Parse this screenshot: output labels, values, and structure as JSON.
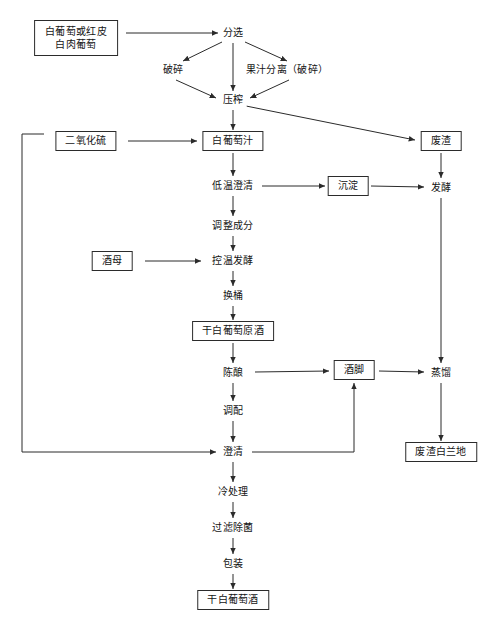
{
  "diagram": {
    "type": "flowchart",
    "orientation": "top-to-bottom",
    "canvas": {
      "width": 504,
      "height": 624
    },
    "colors": {
      "line": "#2b2b2b",
      "text": "#141414",
      "background": "#ffffff"
    },
    "nodes": [
      {
        "id": "grapes",
        "label": "白葡萄或红皮\n白肉葡萄",
        "label_line1": "白葡萄或红皮",
        "label_line2": "白肉葡萄",
        "shape": "box",
        "x": 76,
        "y": 38
      },
      {
        "id": "sorting",
        "label": "分选",
        "shape": "plain",
        "x": 233,
        "y": 33
      },
      {
        "id": "crushing",
        "label": "破碎",
        "shape": "plain",
        "x": 173,
        "y": 70
      },
      {
        "id": "juice-sep",
        "label": "果汁分离（破碎）",
        "shape": "plain",
        "x": 287,
        "y": 70
      },
      {
        "id": "pressing",
        "label": "压榨",
        "shape": "plain",
        "x": 233,
        "y": 100
      },
      {
        "id": "so2",
        "label": "二氧化硫",
        "shape": "box",
        "x": 86,
        "y": 141
      },
      {
        "id": "white-must",
        "label": "白葡萄汁",
        "shape": "box",
        "x": 233,
        "y": 141
      },
      {
        "id": "pomace",
        "label": "废渣",
        "shape": "box",
        "x": 441,
        "y": 141
      },
      {
        "id": "cold-settle",
        "label": "低温澄清",
        "shape": "plain",
        "x": 233,
        "y": 186
      },
      {
        "id": "sediment",
        "label": "沉淀",
        "shape": "box",
        "x": 348,
        "y": 186
      },
      {
        "id": "fermentation",
        "label": "发酵",
        "shape": "plain",
        "x": 441,
        "y": 188
      },
      {
        "id": "adjust",
        "label": "调整成分",
        "shape": "plain",
        "x": 233,
        "y": 226
      },
      {
        "id": "yeast",
        "label": "酒母",
        "shape": "box",
        "x": 112,
        "y": 261
      },
      {
        "id": "temp-ferment",
        "label": "控温发酵",
        "shape": "plain",
        "x": 233,
        "y": 261
      },
      {
        "id": "racking",
        "label": "换桶",
        "shape": "plain",
        "x": 233,
        "y": 296
      },
      {
        "id": "base-wine",
        "label": "干白葡萄原酒",
        "shape": "box",
        "x": 233,
        "y": 331
      },
      {
        "id": "aging",
        "label": "陈酿",
        "shape": "plain",
        "x": 233,
        "y": 373
      },
      {
        "id": "lees",
        "label": "酒脚",
        "shape": "box",
        "x": 354,
        "y": 370
      },
      {
        "id": "distillation",
        "label": "蒸馏",
        "shape": "plain",
        "x": 441,
        "y": 373
      },
      {
        "id": "blending",
        "label": "调配",
        "shape": "plain",
        "x": 233,
        "y": 411
      },
      {
        "id": "clarify",
        "label": "澄清",
        "shape": "plain",
        "x": 233,
        "y": 452
      },
      {
        "id": "pomace-brandy",
        "label": "废渣白兰地",
        "shape": "box",
        "x": 441,
        "y": 452
      },
      {
        "id": "cold-treat",
        "label": "冷处理",
        "shape": "plain",
        "x": 233,
        "y": 492
      },
      {
        "id": "filter",
        "label": "过滤除菌",
        "shape": "plain",
        "x": 233,
        "y": 528
      },
      {
        "id": "packaging",
        "label": "包装",
        "shape": "plain",
        "x": 233,
        "y": 564
      },
      {
        "id": "dry-white",
        "label": "干白葡萄酒",
        "shape": "box",
        "x": 233,
        "y": 600
      }
    ],
    "edges": [
      {
        "from": "grapes",
        "to": "sorting",
        "kind": "straight"
      },
      {
        "from": "sorting",
        "to": "crushing",
        "kind": "diagonal"
      },
      {
        "from": "sorting",
        "to": "pressing",
        "kind": "straight"
      },
      {
        "from": "sorting",
        "to": "juice-sep",
        "kind": "diagonal"
      },
      {
        "from": "crushing",
        "to": "pressing",
        "kind": "diagonal"
      },
      {
        "from": "juice-sep",
        "to": "pressing",
        "kind": "diagonal"
      },
      {
        "from": "pressing",
        "to": "white-must",
        "kind": "straight"
      },
      {
        "from": "pressing",
        "to": "pomace",
        "kind": "diagonal"
      },
      {
        "from": "so2",
        "to": "white-must",
        "kind": "straight"
      },
      {
        "from": "so2",
        "to": "clarify",
        "kind": "orthogonal"
      },
      {
        "from": "white-must",
        "to": "cold-settle",
        "kind": "straight"
      },
      {
        "from": "cold-settle",
        "to": "sediment",
        "kind": "straight"
      },
      {
        "from": "sediment",
        "to": "fermentation",
        "kind": "straight"
      },
      {
        "from": "pomace",
        "to": "fermentation",
        "kind": "straight"
      },
      {
        "from": "cold-settle",
        "to": "adjust",
        "kind": "straight"
      },
      {
        "from": "adjust",
        "to": "temp-ferment",
        "kind": "straight"
      },
      {
        "from": "yeast",
        "to": "temp-ferment",
        "kind": "straight"
      },
      {
        "from": "temp-ferment",
        "to": "racking",
        "kind": "straight"
      },
      {
        "from": "racking",
        "to": "base-wine",
        "kind": "straight"
      },
      {
        "from": "base-wine",
        "to": "aging",
        "kind": "straight"
      },
      {
        "from": "aging",
        "to": "lees",
        "kind": "straight"
      },
      {
        "from": "lees",
        "to": "distillation",
        "kind": "straight"
      },
      {
        "from": "fermentation",
        "to": "distillation",
        "kind": "straight"
      },
      {
        "from": "distillation",
        "to": "pomace-brandy",
        "kind": "straight"
      },
      {
        "from": "aging",
        "to": "blending",
        "kind": "straight"
      },
      {
        "from": "blending",
        "to": "clarify",
        "kind": "straight"
      },
      {
        "from": "clarify",
        "to": "lees",
        "kind": "orthogonal"
      },
      {
        "from": "clarify",
        "to": "cold-treat",
        "kind": "straight"
      },
      {
        "from": "cold-treat",
        "to": "filter",
        "kind": "straight"
      },
      {
        "from": "filter",
        "to": "packaging",
        "kind": "straight"
      },
      {
        "from": "packaging",
        "to": "dry-white",
        "kind": "straight"
      }
    ]
  }
}
